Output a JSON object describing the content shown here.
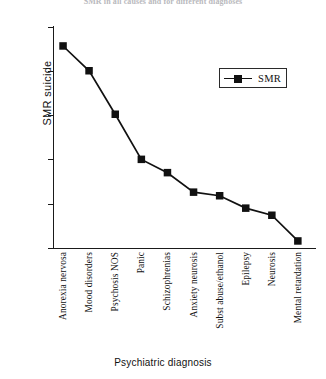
{
  "header": {
    "cut_off_text": "SMR in all causes and for different diagnoses"
  },
  "axis": {
    "ylabel": "SMR suicide",
    "xlabel": "Psychiatric diagnosis",
    "yticks": [
      0,
      5,
      10,
      15,
      20,
      25
    ]
  },
  "legend": {
    "position": "top-right",
    "entries": [
      {
        "label": "SMR",
        "marker": "square",
        "color": "#111111"
      }
    ]
  },
  "colors": {
    "line": "#111111",
    "marker": "#111111",
    "axis": "#1a1a1a",
    "text": "#111111"
  },
  "chart_data": {
    "type": "line",
    "title": "",
    "xlabel": "Psychiatric diagnosis",
    "ylabel": "SMR suicide",
    "ylim": [
      0,
      25
    ],
    "ytick_step": 5,
    "grid": false,
    "legend_position": "top-right",
    "categories": [
      "Anorexia nervosa",
      "Mood disorders",
      "Psychosis NOS",
      "Panic",
      "Schizophrenias",
      "Anxiety neurosis",
      "Subst abuse/ethanol",
      "Epilepsy",
      "Neurosis",
      "Mental retardation"
    ],
    "series": [
      {
        "name": "SMR",
        "values": [
          22.8,
          20.0,
          15.1,
          10.0,
          8.5,
          6.3,
          5.9,
          4.5,
          3.7,
          0.8
        ]
      }
    ]
  }
}
